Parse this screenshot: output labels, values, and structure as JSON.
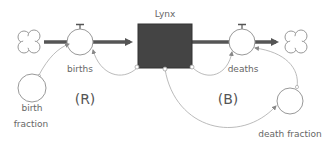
{
  "diagram": {
    "type": "stock-and-flow",
    "stock": {
      "label": "Lynx",
      "fill": "#444444"
    },
    "flows": [
      {
        "id": "births",
        "label": "births"
      },
      {
        "id": "deaths",
        "label": "deaths"
      }
    ],
    "auxiliaries": [
      {
        "id": "birth_fraction",
        "label_line1": "birth",
        "label_line2": "fraction"
      },
      {
        "id": "death_fraction",
        "label": "death fraction"
      }
    ],
    "loops": [
      {
        "id": "reinforcing",
        "label": "(R)"
      },
      {
        "id": "balancing",
        "label": "(B)"
      }
    ],
    "colors": {
      "pipe": "#555555",
      "link": "#aaaaaa",
      "outline": "#999999",
      "text": "#666666"
    }
  }
}
